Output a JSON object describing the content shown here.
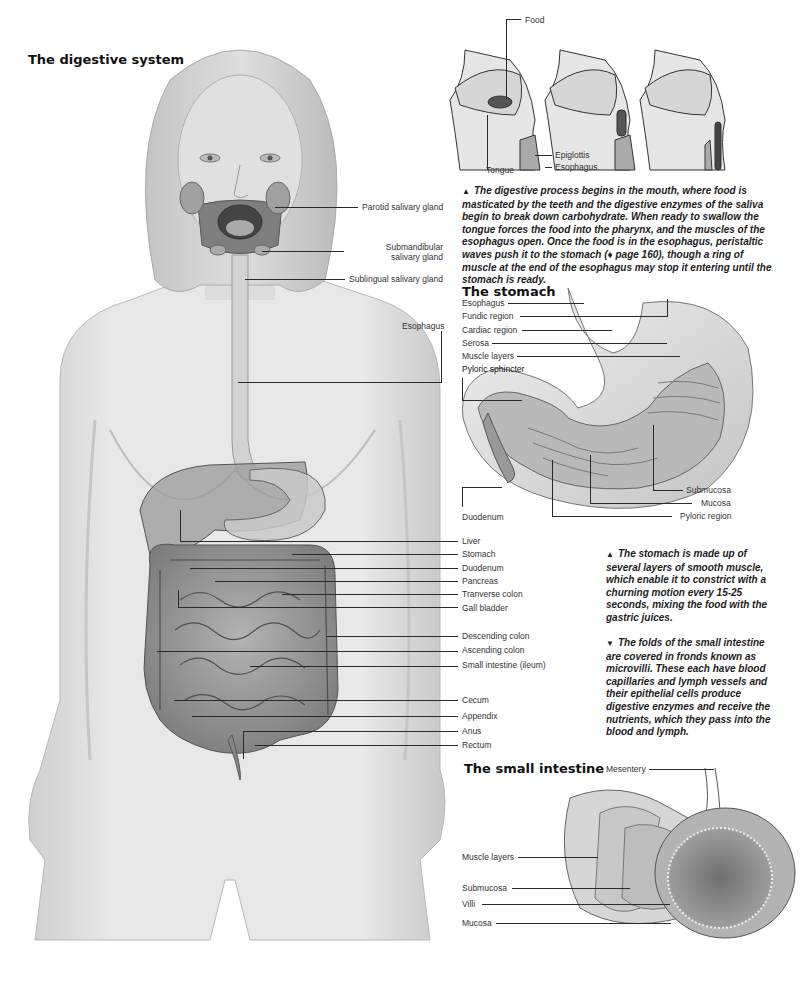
{
  "page": {
    "title": "The digestive system"
  },
  "body_figure": {
    "labels_upper": [
      {
        "id": "parotid",
        "text": "Parotid salivary gland"
      },
      {
        "id": "submandibular",
        "text": "Submandibular salivary gland",
        "line1": "Submandibular",
        "line2": "salivary gland"
      },
      {
        "id": "sublingual",
        "text": "Sublingual salivary gland"
      },
      {
        "id": "esophagus",
        "text": "Esophagus"
      }
    ],
    "labels_organs": [
      "Liver",
      "Stomach",
      "Duodenum",
      "Pancreas",
      "Tranverse colon",
      "Gall bladder",
      "Descending colon",
      "Ascending colon",
      "Small intestine (ileum)",
      "Cecum",
      "Appendix",
      "Anus",
      "Rectum"
    ]
  },
  "swallowing_figure": {
    "labels": {
      "food": "Food",
      "tongue": "Tongue",
      "epiglottis": "Epiglottis",
      "esophagus": "Esophagus"
    },
    "caption_marker": "▲",
    "caption": "The digestive process begins in the mouth, where food is masticated by the teeth and the digestive enzymes of the saliva begin to break down carbohydrate. When ready to swallow the tongue forces the food into the pharynx, and the muscles of the esophagus open. Once the food is in the esophagus, peristaltic waves push it to the stomach (♦ page 160), though a ring of muscle at the end of the esophagus may stop it entering until the stomach is ready."
  },
  "stomach_figure": {
    "title": "The stomach",
    "labels_left": [
      "Esophagus",
      "Fundic region",
      "Cardiac region",
      "Serosa",
      "Muscle layers",
      "Pyloric sphincter"
    ],
    "label_duodenum": "Duodenum",
    "labels_right": [
      "Submucosa",
      "Mucosa",
      "Pyloric region"
    ],
    "caption_marker": "▲",
    "caption": "The stomach is made up of several layers of smooth muscle, which enable it to constrict with a churning motion every 15-25 seconds, mixing the food with the gastric juices."
  },
  "small_intestine_figure": {
    "title": "The small intestine",
    "label_mesentery": "Mesentery",
    "labels_left": [
      "Muscle layers",
      "Submucosa",
      "Villi",
      "Mucosa"
    ],
    "caption_marker": "▼",
    "caption": "The folds of the small intestine are covered in fronds known as microvilli. These each have blood capillaries and lymph vessels and their epithelial cells produce digestive enzymes and receive the nutrients, which they pass into the blood and lymph."
  },
  "colors": {
    "skin": "#e4e4e4",
    "skin_shadow": "#bdbdbd",
    "organ": "#9a9a9a",
    "organ_dark": "#6e6e6e",
    "line": "#2a2a2a",
    "text": "#1a1a1a"
  }
}
